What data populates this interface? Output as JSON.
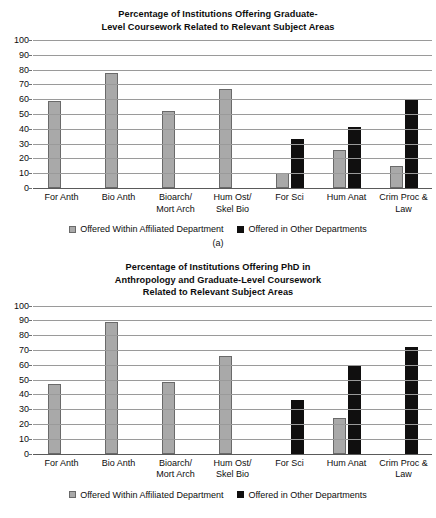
{
  "figure_a": {
    "caption": "(a)",
    "title_lines": [
      "Percentage of Institutions Offering Graduate-",
      "Level Coursework Related to Relevant Subject Areas"
    ],
    "legend": [
      {
        "label": "Offered Within Affiliated Department",
        "swatch": "gray",
        "color": "#a9a9a9"
      },
      {
        "label": "Offered in Other Departments",
        "swatch": "black",
        "color": "#100f0f"
      }
    ],
    "yticks": [
      "0",
      "10",
      "20",
      "30",
      "40",
      "50",
      "60",
      "70",
      "80",
      "90",
      "100"
    ],
    "xlabels": [
      {
        "l1": "For Anth",
        "l2": ""
      },
      {
        "l1": "Bio Anth",
        "l2": ""
      },
      {
        "l1": "Bioarch/",
        "l2": "Mort Arch"
      },
      {
        "l1": "Hum Ost/",
        "l2": "Skel Bio"
      },
      {
        "l1": "For Sci",
        "l2": ""
      },
      {
        "l1": "Hum Anat",
        "l2": ""
      },
      {
        "l1": "Crim Proc &",
        "l2": "Law"
      }
    ]
  },
  "figure_b": {
    "caption": "",
    "title_lines": [
      "Percentage of Institutions Offering PhD in",
      "Anthropology and Graduate-Level Coursework",
      "Related to Relevant Subject Areas"
    ],
    "legend": [
      {
        "label": "Offered Within Affiliated Department",
        "swatch": "gray",
        "color": "#a9a9a9"
      },
      {
        "label": "Offered in Other Departments",
        "swatch": "black",
        "color": "#100f0f"
      }
    ],
    "yticks": [
      "0",
      "10",
      "20",
      "30",
      "40",
      "50",
      "60",
      "70",
      "80",
      "90",
      "100"
    ],
    "xlabels": [
      {
        "l1": "For Anth",
        "l2": ""
      },
      {
        "l1": "Bio Anth",
        "l2": ""
      },
      {
        "l1": "Bioarch/",
        "l2": "Mort Arch"
      },
      {
        "l1": "Hum Ost/",
        "l2": "Skel Bio"
      },
      {
        "l1": "For Sci",
        "l2": ""
      },
      {
        "l1": "Hum Anat",
        "l2": ""
      },
      {
        "l1": "Crim Proc &",
        "l2": "Law"
      }
    ]
  },
  "chart_data": [
    {
      "type": "bar",
      "title": "Percentage of Institutions Offering Graduate-Level Coursework Related to Relevant Subject Areas",
      "subtitle": "(a)",
      "xlabel": "",
      "ylabel": "",
      "ylim": [
        0,
        100
      ],
      "ytick_step": 10,
      "grid": true,
      "legend_position": "bottom",
      "categories": [
        "For Anth",
        "Bio Anth",
        "Bioarch/ Mort Arch",
        "Hum Ost/ Skel Bio",
        "For Sci",
        "Hum Anat",
        "Crim Proc & Law"
      ],
      "series": [
        {
          "name": "Offered Within Affiliated Department",
          "color": "#a9a9a9",
          "values": [
            59,
            78,
            52,
            67,
            10,
            26,
            15
          ]
        },
        {
          "name": "Offered in Other Departments",
          "color": "#100f0f",
          "values": [
            null,
            null,
            null,
            null,
            33,
            41,
            60
          ]
        }
      ]
    },
    {
      "type": "bar",
      "title": "Percentage of Institutions Offering PhD in Anthropology and Graduate-Level Coursework Related to Relevant Subject Areas",
      "subtitle": "",
      "xlabel": "",
      "ylabel": "",
      "ylim": [
        0,
        100
      ],
      "ytick_step": 10,
      "grid": true,
      "legend_position": "bottom",
      "categories": [
        "For Anth",
        "Bio Anth",
        "Bioarch/ Mort Arch",
        "Hum Ost/ Skel Bio",
        "For Sci",
        "Hum Anat",
        "Crim Proc & Law"
      ],
      "series": [
        {
          "name": "Offered Within Affiliated Department",
          "color": "#a9a9a9",
          "values": [
            47,
            89,
            48,
            66,
            null,
            24,
            null
          ]
        },
        {
          "name": "Offered in Other Departments",
          "color": "#100f0f",
          "values": [
            null,
            null,
            null,
            null,
            36,
            60,
            72
          ]
        }
      ]
    }
  ]
}
